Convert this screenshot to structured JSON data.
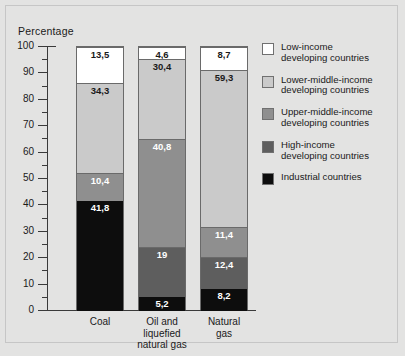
{
  "chart_data": {
    "type": "bar",
    "subtype": "stacked-bar-100",
    "title": "",
    "ylabel": "Percentage",
    "xlabel": "",
    "ylim": [
      0,
      100
    ],
    "ytick_step": 10,
    "yticks": [
      0,
      10,
      20,
      30,
      40,
      50,
      60,
      70,
      80,
      90,
      100
    ],
    "ytick_labels": [
      "0",
      "10",
      "20",
      "30",
      "40",
      "50",
      "60",
      "70",
      "80",
      "90",
      "100"
    ],
    "minor_tick_step": 5,
    "grid": false,
    "legend_position": "right",
    "categories": [
      "Coal",
      "Oil and liquefied natural gas",
      "Natural gas"
    ],
    "category_labels": [
      [
        "Coal"
      ],
      [
        "Oil and",
        "liquefied",
        "natural gas"
      ],
      [
        "Natural",
        "gas"
      ]
    ],
    "series": [
      {
        "name": "Industrial countries",
        "color": "#0d0d0d",
        "label_color": "#ffffff",
        "values": [
          41.8,
          5.2,
          8.2
        ],
        "value_labels": [
          "41,8",
          "5,2",
          "8,2"
        ]
      },
      {
        "name": "High-income developing countries",
        "color": "#5e5e5e",
        "label_color": "#ffffff",
        "values": [
          0,
          19,
          12.4
        ],
        "value_labels": [
          "",
          "19",
          "12,4"
        ]
      },
      {
        "name": "Upper-middle-income developing countries",
        "color": "#8f8f8f",
        "label_color": "#ffffff",
        "values": [
          10.4,
          40.8,
          11.4
        ],
        "value_labels": [
          "10,4",
          "40,8",
          "11,4"
        ]
      },
      {
        "name": "Lower-middle-income developing countries",
        "color": "#cacaca",
        "label_color": "#1a1a1a",
        "values": [
          34.3,
          30.4,
          59.3
        ],
        "value_labels": [
          "34,3",
          "30,4",
          "59,3"
        ]
      },
      {
        "name": "Low-income developing countries",
        "color": "#ffffff",
        "label_color": "#1a1a1a",
        "values": [
          13.5,
          4.6,
          8.7
        ],
        "value_labels": [
          "13,5",
          "4,6",
          "8,7"
        ]
      }
    ],
    "legend": [
      {
        "color": "#ffffff",
        "line1": "Low-income",
        "line2": "developing countries"
      },
      {
        "color": "#cacaca",
        "line1": "Lower-middle-income",
        "line2": "developing countries"
      },
      {
        "color": "#8f8f8f",
        "line1": "Upper-middle-income",
        "line2": "developing countries"
      },
      {
        "color": "#5e5e5e",
        "line1": "High-income",
        "line2": "developing countries"
      },
      {
        "color": "#0d0d0d",
        "line1": "Industrial countries",
        "line2": ""
      }
    ]
  }
}
